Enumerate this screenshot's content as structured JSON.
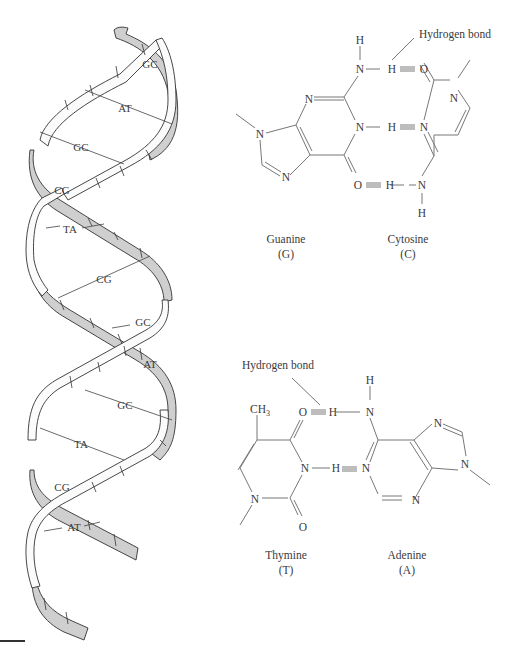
{
  "figure": {
    "helix": {
      "base_pairs": [
        {
          "label": "GC",
          "x": 150,
          "y": 64
        },
        {
          "label": "AT",
          "x": 125,
          "y": 108
        },
        {
          "label": "GC",
          "x": 81,
          "y": 147
        },
        {
          "label": "CG",
          "x": 60,
          "y": 190
        },
        {
          "label": "TA",
          "x": 68,
          "y": 229
        },
        {
          "label": "CG",
          "x": 103,
          "y": 279
        },
        {
          "label": "GC",
          "x": 143,
          "y": 322
        },
        {
          "label": "AT",
          "x": 150,
          "y": 364
        },
        {
          "label": "GC",
          "x": 125,
          "y": 405
        },
        {
          "label": "TA",
          "x": 81,
          "y": 444
        },
        {
          "label": "CG",
          "x": 60,
          "y": 487
        },
        {
          "label": "AT",
          "x": 73,
          "y": 527
        }
      ]
    },
    "gc_pair": {
      "hydrogen_bond_label": "Hydrogen bond",
      "guanine_name": "Guanine",
      "guanine_abbr": "(G)",
      "cytosine_name": "Cytosine",
      "cytosine_abbr": "(C)",
      "atoms": {
        "h_top": "H",
        "n_amino": "N",
        "h_bond1": "H",
        "o_c": "O",
        "n_g3": "N",
        "n_g1": "N",
        "h_bond2": "H",
        "n_c3": "N",
        "n_c1": "N",
        "n_g9": "N",
        "n_g7": "N",
        "o_g": "O",
        "h_bond3": "H",
        "n_c4": "N",
        "h_bot": "H"
      }
    },
    "at_pair": {
      "hydrogen_bond_label": "Hydrogen bond",
      "thymine_name": "Thymine",
      "thymine_abbr": "(T)",
      "adenine_name": "Adenine",
      "adenine_abbr": "(A)",
      "methyl": "CH",
      "methyl_sub": "3",
      "atoms": {
        "o_t4": "O",
        "h_bond1": "H",
        "n_a6": "N",
        "h_top": "H",
        "n_t3": "N",
        "h_bond2": "H",
        "n_a1": "N",
        "n_a7": "N",
        "n_a9": "N",
        "n_a3": "N",
        "n_t1": "N",
        "o_t2": "O"
      }
    }
  }
}
